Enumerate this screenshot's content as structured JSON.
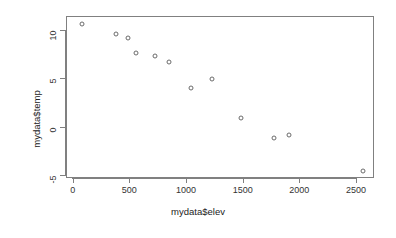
{
  "chart_data": {
    "type": "scatter",
    "title": "",
    "xlabel": "mydata$elev",
    "ylabel": "mydata$temp",
    "xlim": [
      -40,
      2680
    ],
    "ylim": [
      -5.6,
      11.2
    ],
    "xticks": [
      0,
      500,
      1000,
      1500,
      2000,
      2500
    ],
    "xtick_labels": [
      "0",
      "500",
      "1000",
      "1500",
      "2000",
      "2500"
    ],
    "yticks": [
      10,
      5,
      0,
      -5
    ],
    "ytick_labels": [
      "10",
      "5",
      "0",
      "-5"
    ],
    "grid": false,
    "legend": null,
    "marker": "open-circle",
    "marker_color": "#6b6b6b",
    "frame_color": "#808080",
    "points": [
      {
        "x": 82,
        "y": 10.7
      },
      {
        "x": 380,
        "y": 9.65
      },
      {
        "x": 490,
        "y": 9.2
      },
      {
        "x": 555,
        "y": 7.7
      },
      {
        "x": 730,
        "y": 7.3
      },
      {
        "x": 850,
        "y": 6.7
      },
      {
        "x": 1040,
        "y": 4.05
      },
      {
        "x": 1225,
        "y": 5.0
      },
      {
        "x": 1485,
        "y": 0.95
      },
      {
        "x": 1780,
        "y": -1.15
      },
      {
        "x": 1910,
        "y": -0.8
      },
      {
        "x": 2560,
        "y": -4.5
      }
    ],
    "series": [
      {
        "name": "mydata",
        "x": [
          82,
          380,
          490,
          555,
          730,
          850,
          1040,
          1225,
          1485,
          1780,
          1910,
          2560
        ],
        "values": [
          10.7,
          9.65,
          9.2,
          7.7,
          7.3,
          6.7,
          4.05,
          5.0,
          0.95,
          -1.15,
          -0.8,
          -4.5
        ]
      }
    ]
  }
}
